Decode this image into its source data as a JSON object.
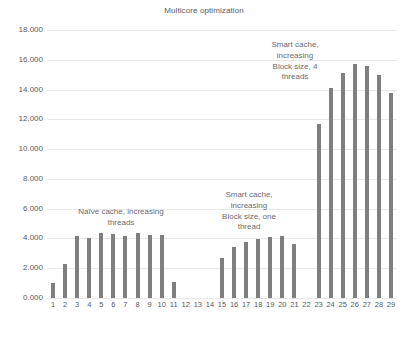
{
  "chart_data": {
    "type": "bar",
    "title": "Multicore optimization",
    "xlabel": "",
    "ylabel": "",
    "grid": true,
    "legend": "none",
    "ylim": [
      0,
      18
    ],
    "ytick_labels": [
      "18.000",
      "16.000",
      "14.000",
      "12.000",
      "10.000",
      "8.000",
      "6.000",
      "4.000",
      "2.000",
      "0.000"
    ],
    "ytick_values": [
      18,
      16,
      14,
      12,
      10,
      8,
      6,
      4,
      2,
      0
    ],
    "categories": [
      "1",
      "2",
      "3",
      "4",
      "5",
      "6",
      "7",
      "8",
      "9",
      "10",
      "11",
      "12",
      "13",
      "14",
      "15",
      "16",
      "17",
      "18",
      "19",
      "20",
      "21",
      "22",
      "23",
      "24",
      "25",
      "26",
      "27",
      "28",
      "29"
    ],
    "values": [
      1.0,
      2.3,
      4.15,
      4.05,
      4.4,
      4.3,
      4.15,
      4.4,
      4.2,
      4.25,
      1.05,
      0,
      0,
      0,
      2.7,
      3.45,
      3.75,
      3.95,
      4.1,
      4.15,
      3.6,
      0,
      11.7,
      14.1,
      15.1,
      15.75,
      15.55,
      14.95,
      13.8
    ],
    "bar_color": "#7f7f7f",
    "annotations": [
      {
        "id": "naive",
        "text": "Naïve cache, increasing\nthreads"
      },
      {
        "id": "smart_one",
        "text": "Smart cache,\nincreasing\nBlock size, one\nthread"
      },
      {
        "id": "smart_four",
        "text": "Smart cache,\nincreasing\nBlock size, 4\nthreads"
      }
    ]
  }
}
